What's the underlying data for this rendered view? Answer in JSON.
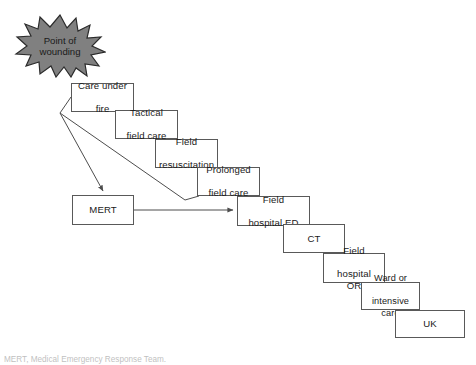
{
  "figure": {
    "type": "flow-diagram",
    "caption": "MERT, Medical Emergency Response Team."
  },
  "origin": {
    "shape": "starburst",
    "name": "point-of-wounding",
    "label_line1": "Point of",
    "label_line2": "wounding",
    "fill_color": "#808080",
    "stroke_color": "#2b2b2b"
  },
  "nodes": [
    {
      "id": "care-under-fire",
      "line1": "Care under",
      "line2": "fire",
      "x": 71,
      "y": 83,
      "w": 63,
      "h": 29
    },
    {
      "id": "tactical-field-care",
      "line1": "Tactical",
      "line2": "field care",
      "x": 115,
      "y": 110,
      "w": 63,
      "h": 29
    },
    {
      "id": "field-resuscitation",
      "line1": "Field",
      "line2": "resuscitation",
      "x": 155,
      "y": 139,
      "w": 63,
      "h": 29
    },
    {
      "id": "prolonged-field-care",
      "line1": "Prolonged",
      "line2": "field care",
      "x": 197,
      "y": 167,
      "w": 63,
      "h": 29
    },
    {
      "id": "mert",
      "line1": "MERT",
      "line2": "",
      "x": 72,
      "y": 195,
      "w": 62,
      "h": 30
    },
    {
      "id": "field-hospital-ed",
      "line1": "Field",
      "line2": "hospital ED",
      "x": 237,
      "y": 196,
      "w": 73,
      "h": 30
    },
    {
      "id": "ct",
      "line1": "CT",
      "line2": "",
      "x": 283,
      "y": 224,
      "w": 62,
      "h": 29
    },
    {
      "id": "field-hospital-or",
      "line1": "Field",
      "line2": "hospital OR",
      "x": 323,
      "y": 253,
      "w": 62,
      "h": 30
    },
    {
      "id": "ward-intensive-care",
      "line1": "Ward or",
      "line2": "intensive care",
      "x": 361,
      "y": 282,
      "w": 59,
      "h": 28
    },
    {
      "id": "uk",
      "line1": "UK",
      "line2": "",
      "x": 395,
      "y": 310,
      "w": 70,
      "h": 28
    }
  ],
  "connectors": [
    {
      "id": "wounding-to-mert",
      "from": "care-under-fire",
      "to": "mert",
      "style": "polyline-arrow"
    },
    {
      "id": "wounding-to-prolonged",
      "from": "care-under-fire",
      "to": "prolonged-field-care",
      "style": "polyline"
    },
    {
      "id": "mert-to-field-hosp-ed",
      "from": "mert",
      "to": "field-hospital-ed",
      "style": "straight-arrow"
    }
  ]
}
